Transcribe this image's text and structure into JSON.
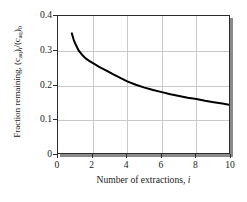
{
  "chart_data": {
    "type": "line",
    "title": "",
    "xlabel": "Number of extractions, i",
    "xlabel_text": "Number of extractions,",
    "xlabel_var": "i",
    "ylabel": "Fraction remaining, (caq)i/(caq)0",
    "ylabel_prefix": "Fraction remaining, (c",
    "ylabel_sub1": "aq",
    "ylabel_mid1": ")",
    "ylabel_sub2": "i",
    "ylabel_mid2": "/(c",
    "ylabel_sub3": "aq",
    "ylabel_mid3": ")",
    "ylabel_sub4": "0",
    "xlim": [
      0,
      10
    ],
    "ylim": [
      0,
      0.4
    ],
    "xticks": [
      0,
      2,
      4,
      6,
      8,
      10
    ],
    "xtick_labels": [
      "0",
      "2",
      "4",
      "6",
      "8",
      "10"
    ],
    "yticks": [
      0,
      0.1,
      0.2,
      0.3,
      0.4
    ],
    "ytick_labels": [
      "0",
      "0.1",
      "0.2",
      "0.3",
      "0.4"
    ],
    "grid": true,
    "grid_axes": "both",
    "grid_color": "#c9c9c9",
    "legend": false,
    "line_color": "#000000",
    "line_width": 2.0,
    "frame_color": "#2b2b2b",
    "background_color": "#ffffff",
    "shadow_color": "#8a8a8a",
    "series": [
      {
        "name": "fraction remaining",
        "x": [
          0.8,
          0.9,
          1.0,
          1.2,
          1.4,
          1.6,
          1.8,
          2.0,
          2.4,
          2.8,
          3.2,
          3.6,
          4.0,
          4.5,
          5.0,
          5.5,
          6.0,
          6.5,
          7.0,
          7.5,
          8.0,
          8.5,
          9.0,
          9.5,
          10.0
        ],
        "y": [
          0.35,
          0.333,
          0.32,
          0.3,
          0.288,
          0.278,
          0.271,
          0.265,
          0.253,
          0.243,
          0.232,
          0.222,
          0.212,
          0.202,
          0.194,
          0.187,
          0.181,
          0.175,
          0.17,
          0.165,
          0.161,
          0.156,
          0.152,
          0.148,
          0.144
        ]
      }
    ]
  }
}
